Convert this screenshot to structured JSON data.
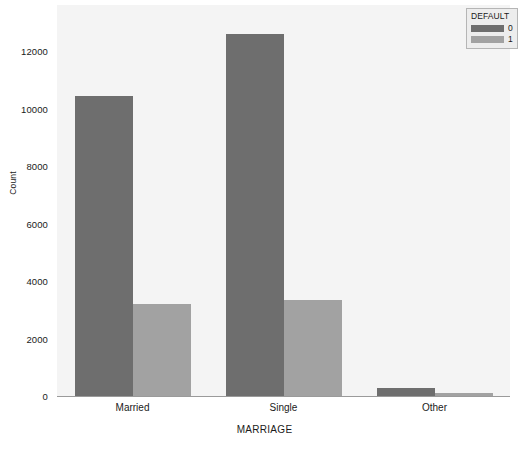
{
  "chart_data": {
    "type": "bar",
    "title": "",
    "subtitle": "",
    "xlabel": "MARRIAGE",
    "ylabel": "Count",
    "categories": [
      "Married",
      "Single",
      "Other"
    ],
    "series": [
      {
        "name": "0",
        "values": [
          10450,
          12600,
          280
        ]
      },
      {
        "name": "1",
        "values": [
          3200,
          3330,
          90
        ]
      }
    ],
    "legend": {
      "title": "DEFAULT",
      "position": "upper right",
      "entries": [
        "0",
        "1"
      ]
    },
    "ylim": [
      0,
      13600
    ],
    "yticks": [
      0,
      2000,
      4000,
      6000,
      8000,
      10000,
      12000
    ],
    "ytick_labels": [
      "0",
      "2000",
      "4000",
      "6000",
      "8000",
      "10000",
      "12000"
    ],
    "xtick_labels": [
      "Married",
      "Single",
      "Other"
    ],
    "grid": false,
    "colors": {
      "series_0": "#6e6e6e",
      "series_1": "#a2a2a2",
      "plot_background": "#f4f4f4",
      "figure_background": "#ffffff",
      "axis_line": "#9a9a9a",
      "text": "#1a1a1a",
      "legend_background": "#ededed",
      "legend_border": "#b5b5b5"
    }
  }
}
